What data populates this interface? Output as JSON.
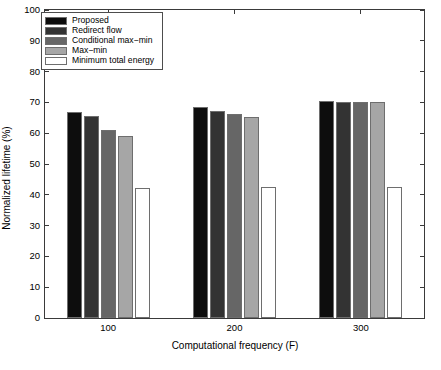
{
  "chart_data": {
    "type": "bar",
    "title": "",
    "xlabel": "Computational frequency (F)",
    "ylabel": "Normalized lifetime (%)",
    "categories": [
      "100",
      "200",
      "300"
    ],
    "xtick_labels": [
      "100",
      "200",
      "300"
    ],
    "ytick_labels": [
      "0",
      "10",
      "20",
      "30",
      "40",
      "50",
      "60",
      "70",
      "80",
      "90",
      "100"
    ],
    "ylim": [
      0,
      100
    ],
    "ytick_step": 10,
    "grid": false,
    "legend_position": "upper-left inside",
    "series": [
      {
        "name": "Proposed",
        "color": "#0d0d0d",
        "values": [
          67.0,
          68.5,
          70.5
        ]
      },
      {
        "name": "Redirect flow",
        "color": "#333333",
        "values": [
          65.5,
          67.3,
          70.0
        ]
      },
      {
        "name": "Conditional max-min",
        "color": "#666666",
        "values": [
          61.0,
          66.3,
          70.0
        ]
      },
      {
        "name": "Max-min",
        "color": "#a6a6a6",
        "values": [
          59.0,
          65.4,
          70.0
        ]
      },
      {
        "name": "Minimum total energy",
        "color": "#ffffff",
        "values": [
          42.3,
          42.5,
          42.5
        ]
      }
    ]
  },
  "legend": {
    "items": [
      {
        "label": "Proposed",
        "color": "#0d0d0d"
      },
      {
        "label": "Redirect flow",
        "color": "#333333"
      },
      {
        "label": "Conditional max−min",
        "color": "#666666"
      },
      {
        "label": "Max−min",
        "color": "#a6a6a6"
      },
      {
        "label": "Minimum total energy",
        "color": "#ffffff"
      }
    ]
  },
  "style": {
    "axis_color": "#3a3a3a",
    "bar_edge_color": "#6e6e6e",
    "background": "#ffffff"
  }
}
